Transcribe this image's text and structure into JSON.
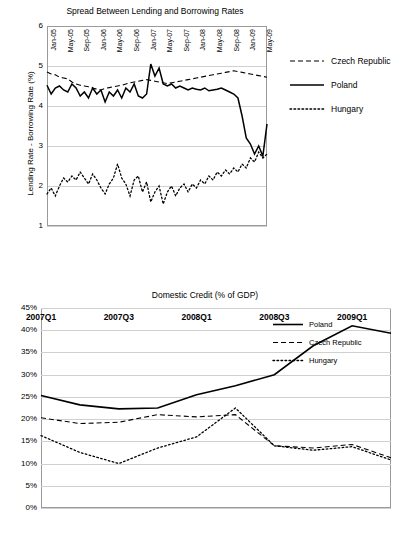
{
  "chart_data": [
    {
      "type": "line",
      "title": "Spread Between Lending and Borrowing Rates",
      "xlabel": "",
      "ylabel": "Lending Rate - Borrowing Rate (%)",
      "ylim": [
        1,
        6
      ],
      "yticks": [
        "1",
        "2",
        "3",
        "4",
        "5",
        "6"
      ],
      "grid": true,
      "legend_position": "right",
      "xticklabels": [
        "Jan-05",
        "May-05",
        "Sep-05",
        "Jan-06",
        "May-06",
        "Sep-06",
        "Jan-07",
        "May-07",
        "Sep-07",
        "Jan-08",
        "May-08",
        "Sep-08",
        "Jan-09",
        "May-09"
      ],
      "x": [
        "Jan-05",
        "Feb-05",
        "Mar-05",
        "Apr-05",
        "May-05",
        "Jun-05",
        "Jul-05",
        "Aug-05",
        "Sep-05",
        "Oct-05",
        "Nov-05",
        "Dec-05",
        "Jan-06",
        "Feb-06",
        "Mar-06",
        "Apr-06",
        "May-06",
        "Jun-06",
        "Jul-06",
        "Aug-06",
        "Sep-06",
        "Oct-06",
        "Nov-06",
        "Dec-06",
        "Jan-07",
        "Feb-07",
        "Mar-07",
        "Apr-07",
        "May-07",
        "Jun-07",
        "Jul-07",
        "Aug-07",
        "Sep-07",
        "Oct-07",
        "Nov-07",
        "Dec-07",
        "Jan-08",
        "Feb-08",
        "Mar-08",
        "Apr-08",
        "May-08",
        "Jun-08",
        "Jul-08",
        "Aug-08",
        "Sep-08",
        "Oct-08",
        "Nov-08",
        "Dec-08",
        "Jan-09",
        "Feb-09",
        "Mar-09",
        "Apr-09",
        "May-09",
        "Jun-09"
      ],
      "series": [
        {
          "name": "Czech Republic",
          "style": "dashed",
          "color": "#000000",
          "values": [
            4.85,
            4.8,
            4.78,
            4.72,
            4.7,
            4.68,
            4.6,
            4.55,
            4.52,
            4.5,
            4.48,
            4.45,
            4.42,
            4.4,
            4.44,
            4.46,
            4.48,
            4.5,
            4.52,
            4.55,
            4.58,
            4.6,
            4.62,
            4.64,
            4.66,
            4.64,
            4.62,
            4.6,
            4.58,
            4.56,
            4.58,
            4.6,
            4.62,
            4.64,
            4.66,
            4.68,
            4.7,
            4.72,
            4.74,
            4.76,
            4.78,
            4.8,
            4.82,
            4.84,
            4.86,
            4.88,
            4.86,
            4.84,
            4.82,
            4.8,
            4.78,
            4.76,
            4.74,
            4.72
          ]
        },
        {
          "name": "Poland",
          "style": "solid",
          "color": "#000000",
          "values": [
            4.52,
            4.3,
            4.45,
            4.5,
            4.4,
            4.35,
            4.55,
            4.45,
            4.25,
            4.35,
            4.2,
            4.45,
            4.3,
            4.4,
            4.1,
            4.35,
            4.25,
            4.4,
            4.2,
            4.45,
            4.35,
            4.55,
            4.25,
            4.2,
            4.3,
            5.05,
            4.75,
            4.95,
            4.55,
            4.5,
            4.55,
            4.45,
            4.5,
            4.45,
            4.4,
            4.45,
            4.42,
            4.4,
            4.45,
            4.38,
            4.4,
            4.42,
            4.45,
            4.4,
            4.35,
            4.3,
            4.2,
            3.75,
            3.2,
            3.05,
            2.8,
            3.0,
            2.75,
            3.55
          ]
        },
        {
          "name": "Hungary",
          "style": "dotted",
          "color": "#000000",
          "values": [
            1.8,
            1.95,
            1.75,
            2.0,
            2.2,
            2.1,
            2.25,
            2.15,
            2.35,
            2.2,
            2.05,
            2.3,
            2.15,
            1.95,
            1.8,
            2.05,
            2.2,
            2.55,
            2.2,
            2.05,
            1.75,
            2.15,
            2.25,
            1.85,
            2.1,
            1.6,
            1.85,
            2.0,
            1.55,
            1.85,
            2.0,
            1.75,
            1.95,
            2.05,
            1.85,
            2.05,
            1.95,
            2.15,
            2.05,
            2.25,
            2.15,
            2.35,
            2.25,
            2.4,
            2.3,
            2.45,
            2.35,
            2.55,
            2.45,
            2.7,
            2.6,
            2.85,
            2.7,
            2.8
          ]
        }
      ]
    },
    {
      "type": "line",
      "title": "Domestic Credit (% of GDP)",
      "xlabel": "",
      "ylabel": "",
      "ylim": [
        0,
        45
      ],
      "yticks": [
        "0%",
        "5%",
        "10%",
        "15%",
        "20%",
        "25%",
        "30%",
        "35%",
        "40%",
        "45%"
      ],
      "grid": true,
      "legend_position": "inside-right",
      "xticklabels": [
        "2007Q1",
        "2007Q3",
        "2008Q1",
        "2008Q3",
        "2009Q1"
      ],
      "x": [
        "2007Q1",
        "2007Q2",
        "2007Q3",
        "2007Q4",
        "2008Q1",
        "2008Q2",
        "2008Q3",
        "2008Q4",
        "2009Q1",
        "2009Q2"
      ],
      "series": [
        {
          "name": "Poland",
          "style": "solid",
          "color": "#000000",
          "values": [
            25.3,
            23.2,
            22.3,
            22.5,
            25.5,
            27.5,
            30.0,
            36.5,
            41.0,
            39.3
          ]
        },
        {
          "name": "Czech Republic",
          "style": "dashed",
          "color": "#000000",
          "values": [
            20.3,
            19.0,
            19.3,
            21.0,
            20.5,
            21.0,
            14.0,
            13.5,
            14.3,
            11.3
          ]
        },
        {
          "name": "Hungary",
          "style": "dotted",
          "color": "#000000",
          "values": [
            16.3,
            12.5,
            10.0,
            13.5,
            16.0,
            22.5,
            14.0,
            13.0,
            13.8,
            10.8
          ]
        }
      ]
    }
  ]
}
